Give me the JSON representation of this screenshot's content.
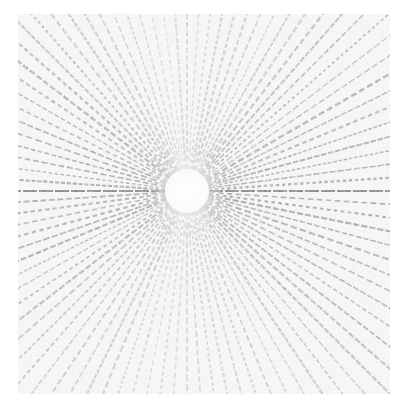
{
  "image": {
    "description": "Radial starburst / diffraction-like pattern with dense rays emanating from a bright center",
    "background_color": "#ffffff",
    "field_color": "#f2f2f2",
    "ray_color": "#5a5a5a",
    "center_glow_color": "#ffffff",
    "pattern_box": {
      "x": 18,
      "y": 14,
      "width": 372,
      "height": 380
    },
    "center": {
      "x": 187,
      "y": 191
    },
    "ray_count": 96,
    "strong_axes_deg": [
      0,
      180
    ],
    "center_radius": 22
  }
}
